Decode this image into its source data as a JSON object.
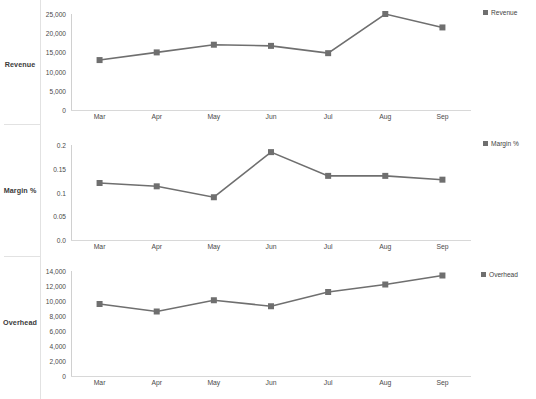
{
  "chart_data": [
    {
      "type": "line",
      "title": "Revenue",
      "series_name": "Revenue",
      "legend_label": "Revenue",
      "row_label": "Revenue",
      "xlabel": "",
      "ylabel": "Revenue",
      "legend_position": "right",
      "grid": false,
      "categories": [
        "Mar",
        "Apr",
        "May",
        "Jun",
        "Jul",
        "Aug",
        "Sep"
      ],
      "values": [
        13000,
        15000,
        17000,
        16700,
        14800,
        25000,
        21500
      ],
      "ylim": [
        0,
        25000
      ],
      "yticks": [
        0,
        5000,
        10000,
        15000,
        20000,
        25000
      ],
      "ytick_labels": [
        "0",
        "5,000",
        "10,000",
        "15,000",
        "20,000",
        "25,000"
      ],
      "color": "#6f6f6f"
    },
    {
      "type": "line",
      "title": "Margin %",
      "series_name": "Margin %",
      "legend_label": "Margin %",
      "row_label": "Margin %",
      "xlabel": "",
      "ylabel": "Margin %",
      "legend_position": "right",
      "grid": false,
      "categories": [
        "Mar",
        "Apr",
        "May",
        "Jun",
        "Jul",
        "Aug",
        "Sep"
      ],
      "values": [
        0.12,
        0.113,
        0.09,
        0.185,
        0.135,
        0.135,
        0.127
      ],
      "ylim": [
        0,
        0.2
      ],
      "yticks": [
        0,
        0.05,
        0.1,
        0.15,
        0.2
      ],
      "ytick_labels": [
        "0.0",
        "0.05",
        "0.1",
        "0.15",
        "0.2"
      ],
      "color": "#6f6f6f"
    },
    {
      "type": "line",
      "title": "Overhead",
      "series_name": "Overhead",
      "legend_label": "Overhead",
      "row_label": "Overhead",
      "xlabel": "",
      "ylabel": "Overhead",
      "legend_position": "right",
      "grid": false,
      "categories": [
        "Mar",
        "Apr",
        "May",
        "Jun",
        "Jul",
        "Aug",
        "Sep"
      ],
      "values": [
        9600,
        8600,
        10100,
        9300,
        11200,
        12200,
        13400
      ],
      "ylim": [
        0,
        14000
      ],
      "yticks": [
        0,
        2000,
        4000,
        6000,
        8000,
        10000,
        12000,
        14000
      ],
      "ytick_labels": [
        "0",
        "2,000",
        "4,000",
        "6,000",
        "8,000",
        "10,000",
        "12,000",
        "14,000"
      ],
      "color": "#6f6f6f"
    }
  ],
  "layout": {
    "panels": [
      {
        "top": 6,
        "plot_left": 71,
        "plot_top": 14,
        "plot_width": 400,
        "plot_height": 96,
        "label_top": 60,
        "legend_left": 483,
        "legend_top": 9,
        "ytick_right": 66
      },
      {
        "top": 136,
        "plot_left": 71,
        "plot_top": 145,
        "plot_width": 400,
        "plot_height": 95,
        "label_top": 186,
        "legend_left": 483,
        "legend_top": 140,
        "ytick_right": 66
      },
      {
        "top": 266,
        "plot_left": 71,
        "plot_top": 271,
        "plot_width": 400,
        "plot_height": 105,
        "label_top": 318,
        "legend_left": 483,
        "legend_top": 271,
        "ytick_right": 66
      }
    ],
    "rail_dividers_y": [
      124,
      256
    ],
    "accent_color": "#6f6f6f",
    "axis_color": "#d4d4d4"
  }
}
